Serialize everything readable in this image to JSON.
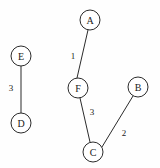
{
  "figure": {
    "background_color": "#fefefe",
    "line_color": "#2b2b2b",
    "node_fill_color": "#ffffff",
    "text_color": "#1a1a1a",
    "width": 160,
    "height": 168
  },
  "chart_data": {
    "type": "diagram",
    "title": "",
    "xlabel": "",
    "ylabel": "",
    "graph_type": "undirected weighted graph",
    "nodes": [
      {
        "id": "A",
        "label": "A",
        "x": 90,
        "y": 20,
        "r": 10
      },
      {
        "id": "E",
        "label": "E",
        "x": 21,
        "y": 56,
        "r": 10
      },
      {
        "id": "B",
        "label": "B",
        "x": 138,
        "y": 87,
        "r": 10
      },
      {
        "id": "F",
        "label": "F",
        "x": 78,
        "y": 88,
        "r": 10
      },
      {
        "id": "D",
        "label": "D",
        "x": 21,
        "y": 123,
        "r": 10
      },
      {
        "id": "C",
        "label": "C",
        "x": 93,
        "y": 152,
        "r": 10
      }
    ],
    "edges": [
      {
        "source": "A",
        "target": "F",
        "weight": "1",
        "x1": 88,
        "y1": 30,
        "x2": 77,
        "y2": 78,
        "lx": 73,
        "ly": 56
      },
      {
        "source": "F",
        "target": "C",
        "weight": "3",
        "x1": 80,
        "y1": 98,
        "x2": 90,
        "y2": 142,
        "lx": 92,
        "ly": 112
      },
      {
        "source": "C",
        "target": "B",
        "weight": "2",
        "x1": 102,
        "y1": 147,
        "x2": 133,
        "y2": 96,
        "lx": 124,
        "ly": 133
      },
      {
        "source": "E",
        "target": "D",
        "weight": "3",
        "x1": 21,
        "y1": 66,
        "x2": 21,
        "y2": 113,
        "lx": 11,
        "ly": 88
      }
    ]
  }
}
